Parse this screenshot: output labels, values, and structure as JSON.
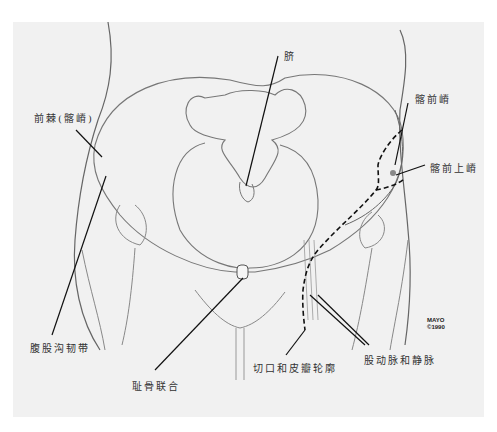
{
  "figure": {
    "labels": {
      "umbilicus": "脐",
      "anterior_spine_iliac_crest": "前棘(髂嵴)",
      "iliac_crest": "髂前嵴",
      "asis": "髂前上嵴",
      "inguinal_ligament": "腹股沟韧带",
      "pubic_symphysis": "耻骨联合",
      "incision_and_flap_outline": "切口和皮瓣轮廓",
      "femoral_artery_vein": "股动脉和静脉"
    },
    "credit": {
      "line1": "MAYO",
      "line2": "©1990"
    },
    "colors": {
      "background": "#f1f1f1",
      "line": "#555555",
      "leader": "#111111",
      "text": "#333333"
    }
  }
}
